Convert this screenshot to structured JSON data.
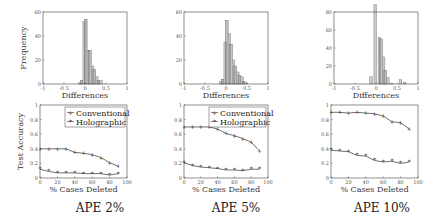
{
  "chart_data": [
    {
      "type": "bar",
      "panel": "APE 2% histogram",
      "title": "",
      "xlabel": "Differences",
      "ylabel": "Frequency",
      "xlim": [
        -1,
        1
      ],
      "ylim": [
        0,
        60
      ],
      "xticks": [
        "-1",
        "-0.5",
        "0",
        "0.5",
        "1"
      ],
      "yticks": [
        "0",
        "20",
        "40",
        "60"
      ],
      "bins": [
        {
          "x0": -0.15,
          "x1": -0.05,
          "a": 1,
          "b": 3
        },
        {
          "x0": -0.05,
          "x1": 0.05,
          "a": 52,
          "b": 54
        },
        {
          "x0": 0.05,
          "x1": 0.15,
          "a": 28,
          "b": 28
        },
        {
          "x0": 0.15,
          "x1": 0.25,
          "a": 15,
          "b": 12
        },
        {
          "x0": 0.25,
          "x1": 0.35,
          "a": 6,
          "b": 3
        },
        {
          "x0": 0.35,
          "x1": 0.45,
          "a": 3,
          "b": 0
        }
      ]
    },
    {
      "type": "bar",
      "panel": "APE 5% histogram",
      "title": "",
      "xlabel": "Differences",
      "ylabel": "",
      "xlim": [
        -1,
        1
      ],
      "ylim": [
        0,
        60
      ],
      "xticks": [
        "-1",
        "-0.5",
        "0",
        "0.5",
        "1"
      ],
      "yticks": [
        "0",
        "20",
        "40",
        "60"
      ],
      "bins": [
        {
          "x0": -0.15,
          "x1": -0.05,
          "a": 2,
          "b": 4
        },
        {
          "x0": -0.05,
          "x1": 0.05,
          "a": 35,
          "b": 53
        },
        {
          "x0": 0.05,
          "x1": 0.15,
          "a": 42,
          "b": 33
        },
        {
          "x0": 0.15,
          "x1": 0.25,
          "a": 20,
          "b": 15
        },
        {
          "x0": 0.25,
          "x1": 0.35,
          "a": 10,
          "b": 7
        },
        {
          "x0": 0.35,
          "x1": 0.45,
          "a": 6,
          "b": 2
        },
        {
          "x0": 0.45,
          "x1": 0.55,
          "a": 1,
          "b": 0
        }
      ]
    },
    {
      "type": "bar",
      "panel": "APE 10% histogram",
      "title": "",
      "xlabel": "Differences",
      "ylabel": "",
      "xlim": [
        -1,
        1
      ],
      "ylim": [
        0,
        80
      ],
      "xticks": [
        "-1",
        "-0.5",
        "0",
        "0.5",
        "1"
      ],
      "yticks": [
        "0",
        "20",
        "40",
        "60",
        "80"
      ],
      "bins": [
        {
          "x0": -0.15,
          "x1": -0.05,
          "a": 8,
          "b": 0
        },
        {
          "x0": -0.05,
          "x1": 0.05,
          "a": 88,
          "b": 0
        },
        {
          "x0": 0.05,
          "x1": 0.15,
          "a": 52,
          "b": 50
        },
        {
          "x0": 0.15,
          "x1": 0.25,
          "a": 30,
          "b": 15
        },
        {
          "x0": 0.25,
          "x1": 0.35,
          "a": 7,
          "b": 0
        },
        {
          "x0": 0.35,
          "x1": 0.45,
          "a": 1,
          "b": 0
        },
        {
          "x0": 0.55,
          "x1": 0.65,
          "a": 5,
          "b": 0
        },
        {
          "x0": 0.65,
          "x1": 0.75,
          "a": 2,
          "b": 0
        }
      ]
    },
    {
      "type": "line",
      "panel": "APE 2% accuracy",
      "xlabel": "% Cases Deleted",
      "ylabel": "Test Accuracy",
      "xlim": [
        0,
        100
      ],
      "ylim": [
        0,
        1
      ],
      "xticks": [
        "0",
        "20",
        "40",
        "60",
        "80",
        "100"
      ],
      "yticks": [
        "0",
        "0.2",
        "0.4",
        "0.6",
        "0.8",
        "1"
      ],
      "legend": true,
      "x": [
        0,
        10,
        20,
        30,
        40,
        50,
        60,
        70,
        80,
        90
      ],
      "series": [
        {
          "name": "Conventional",
          "marker": "+",
          "values": [
            0.4,
            0.4,
            0.4,
            0.4,
            0.35,
            0.34,
            0.32,
            0.28,
            0.21,
            0.16
          ]
        },
        {
          "name": "Holographic",
          "marker": "*",
          "values": [
            0.12,
            0.09,
            0.07,
            0.07,
            0.07,
            0.06,
            0.06,
            0.06,
            0.04,
            0.06
          ]
        }
      ]
    },
    {
      "type": "line",
      "panel": "APE 5% accuracy",
      "xlabel": "% Cases Deleted",
      "ylabel": "",
      "xlim": [
        0,
        100
      ],
      "ylim": [
        0,
        1
      ],
      "xticks": [
        "0",
        "20",
        "40",
        "60",
        "80",
        "100"
      ],
      "yticks": [
        "0",
        "0.2",
        "0.4",
        "0.6",
        "0.8",
        "1"
      ],
      "legend": true,
      "x": [
        0,
        10,
        20,
        30,
        40,
        50,
        60,
        70,
        80,
        90
      ],
      "series": [
        {
          "name": "Conventional",
          "marker": "+",
          "values": [
            0.7,
            0.7,
            0.7,
            0.7,
            0.67,
            0.61,
            0.58,
            0.54,
            0.49,
            0.37
          ]
        },
        {
          "name": "Holographic",
          "marker": "*",
          "values": [
            0.21,
            0.17,
            0.15,
            0.14,
            0.13,
            0.11,
            0.11,
            0.1,
            0.12,
            0.12
          ]
        }
      ]
    },
    {
      "type": "line",
      "panel": "APE 10% accuracy",
      "xlabel": "% Cases Deleted",
      "ylabel": "",
      "xlim": [
        0,
        100
      ],
      "ylim": [
        0,
        1
      ],
      "xticks": [
        "0",
        "20",
        "40",
        "60",
        "80",
        "100"
      ],
      "yticks": [
        "0",
        "0.2",
        "0.4",
        "0.6",
        "0.8",
        "1"
      ],
      "legend": false,
      "x": [
        0,
        10,
        20,
        30,
        40,
        50,
        60,
        70,
        80,
        90
      ],
      "series": [
        {
          "name": "Conventional",
          "marker": "+",
          "values": [
            0.9,
            0.9,
            0.89,
            0.9,
            0.89,
            0.88,
            0.85,
            0.77,
            0.76,
            0.67
          ]
        },
        {
          "name": "Holographic",
          "marker": "*",
          "values": [
            0.38,
            0.37,
            0.36,
            0.31,
            0.3,
            0.24,
            0.22,
            0.23,
            0.2,
            0.22
          ]
        }
      ]
    }
  ],
  "panel_titles": [
    "APE 2%",
    "APE 5%",
    "APE 10%"
  ],
  "colors": {
    "bar_a": "#c8c8c8",
    "bar_b": "#9a9a9a",
    "axis": "#444444",
    "line": "#333333"
  }
}
